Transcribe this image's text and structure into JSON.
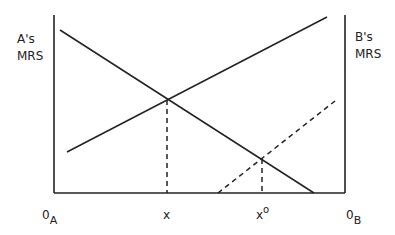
{
  "diagram": {
    "left_axis_label": {
      "line1": "A's",
      "line2": "MRS"
    },
    "right_axis_label": {
      "line1": "B's",
      "line2": "MRS"
    },
    "origin_left": {
      "main": "0",
      "sub": "A"
    },
    "origin_right": {
      "main": "0",
      "sub": "B"
    },
    "tick_x": "x",
    "tick_x0": {
      "main": "x",
      "sup": "o"
    },
    "colors": {
      "line": "#222222",
      "background": "#ffffff"
    },
    "lines": [
      {
        "name": "A's MRS curve",
        "style": "solid",
        "from": [
          60,
          30
        ],
        "to": [
          314,
          193
        ]
      },
      {
        "name": "B's MRS curve",
        "style": "solid",
        "from": [
          67,
          152
        ],
        "to": [
          327,
          17
        ]
      },
      {
        "name": "shifted B's MRS curve",
        "style": "dashed",
        "from": [
          218,
          193
        ],
        "to": [
          335,
          101
        ]
      }
    ],
    "equilibria": [
      {
        "label": "x",
        "point": [
          167,
          100
        ]
      },
      {
        "label": "x°",
        "point": [
          262,
          159
        ]
      }
    ]
  }
}
